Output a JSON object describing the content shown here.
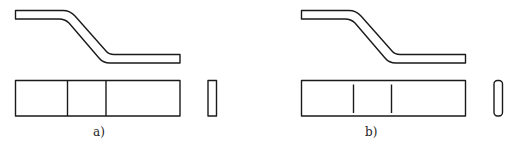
{
  "diagram": {
    "type": "technical-drawing",
    "background": "#ffffff",
    "line_color": "#1a1a1a",
    "panels": [
      {
        "id": "a",
        "label": "a)",
        "top_view": "bent-strip",
        "front_view": {
          "sections": 3,
          "dividers": "full-height"
        },
        "side_view": {
          "corners": "square"
        }
      },
      {
        "id": "b",
        "label": "b)",
        "top_view": "bent-strip",
        "front_view": {
          "sections": 3,
          "dividers": "partial-height"
        },
        "side_view": {
          "corners": "rounded"
        }
      }
    ]
  }
}
